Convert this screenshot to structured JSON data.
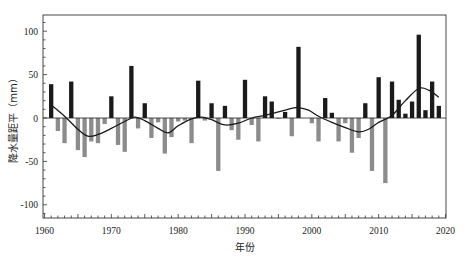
{
  "chart_data": {
    "type": "bar",
    "title": "",
    "xlabel": "年份",
    "ylabel": "降水量距平（mm）",
    "xlim": [
      1960,
      2020
    ],
    "ylim": [
      -120,
      120
    ],
    "xticks": [
      1960,
      1970,
      1980,
      1990,
      2000,
      2010,
      2020
    ],
    "yticks": [
      -100,
      -50,
      0,
      50,
      100
    ],
    "grid": false,
    "legend": null,
    "colors": {
      "positive": "#1a1a1a",
      "negative": "#8c8c8c",
      "trend": "#1a1a1a"
    },
    "categories": [
      1961,
      1962,
      1963,
      1964,
      1965,
      1966,
      1967,
      1968,
      1969,
      1970,
      1971,
      1972,
      1973,
      1974,
      1975,
      1976,
      1977,
      1978,
      1979,
      1980,
      1981,
      1982,
      1983,
      1984,
      1985,
      1986,
      1987,
      1988,
      1989,
      1990,
      1991,
      1992,
      1993,
      1994,
      1995,
      1996,
      1997,
      1998,
      1999,
      2000,
      2001,
      2002,
      2003,
      2004,
      2005,
      2006,
      2007,
      2008,
      2009,
      2010,
      2011,
      2012,
      2013,
      2014,
      2015,
      2016,
      2017,
      2018,
      2019
    ],
    "series": [
      {
        "name": "降水量距平",
        "type": "bar",
        "values": [
          39,
          -15,
          -29,
          42,
          -37,
          -45,
          -27,
          -29,
          -7,
          25,
          -31,
          -39,
          60,
          -12,
          17,
          -23,
          -5,
          -41,
          -22,
          -4,
          -3,
          -29,
          43,
          -3,
          17,
          -61,
          14,
          -14,
          -25,
          44,
          -8,
          -27,
          25,
          19,
          -1,
          7,
          -21,
          82,
          0,
          -6,
          -27,
          23,
          6,
          -27,
          -6,
          -40,
          -23,
          17,
          -61,
          47,
          -75,
          42,
          21,
          5,
          19,
          96,
          9,
          42,
          14
        ]
      },
      {
        "name": "趋势线",
        "type": "line",
        "x": [
          1961,
          1963,
          1965,
          1966.5,
          1968,
          1970,
          1972,
          1973.5,
          1975,
          1977,
          1978.5,
          1980,
          1982,
          1983.5,
          1985,
          1987,
          1989,
          1991,
          1993,
          1995,
          1997,
          1998,
          1999.5,
          2001,
          2003,
          2005,
          2007,
          2008.5,
          2010,
          2012,
          2014,
          2016,
          2017.5,
          2019
        ],
        "values": [
          15,
          2,
          -13,
          -21,
          -19,
          -12,
          -4,
          1,
          -3,
          -12,
          -17,
          -9,
          -1,
          1,
          -2,
          -8,
          -6,
          0,
          3,
          7,
          11,
          12,
          9,
          2,
          -5,
          -11,
          -16,
          -13,
          -5,
          3,
          20,
          34,
          32,
          24
        ]
      }
    ]
  }
}
